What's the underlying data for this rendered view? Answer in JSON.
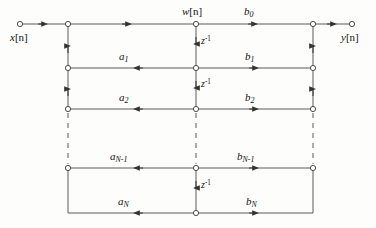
{
  "figure": {
    "kind": "signal-flow-graph",
    "background_color": "#fdfdfb",
    "line_color": "#555555",
    "text_color": "#111111"
  },
  "signals": {
    "input_label": "x[n]",
    "input_base": "x",
    "input_index": "[n]",
    "output_label": "y[n]",
    "output_base": "y",
    "output_index": "[n]",
    "state_label": "w[n]",
    "state_base": "w",
    "state_index": "[n]"
  },
  "delay": {
    "label": "z",
    "exponent": "-1",
    "full_label": "z^-1",
    "count": 4
  },
  "feedback_coefficients": [
    {
      "id": "a1",
      "base": "a",
      "subscript": "1",
      "label": "a1",
      "row": 1
    },
    {
      "id": "a2",
      "base": "a",
      "subscript": "2",
      "label": "a2",
      "row": 2
    },
    {
      "id": "aNm1",
      "base": "a",
      "subscript": "N-1",
      "label": "aN-1",
      "row": 3
    },
    {
      "id": "aN",
      "base": "a",
      "subscript": "N",
      "label": "aN",
      "row": 4
    }
  ],
  "feedforward_coefficients": [
    {
      "id": "b0",
      "base": "b",
      "subscript": "0",
      "label": "b0",
      "row": 0
    },
    {
      "id": "b1",
      "base": "b",
      "subscript": "1",
      "label": "b1",
      "row": 1
    },
    {
      "id": "b2",
      "base": "b",
      "subscript": "2",
      "label": "b2",
      "row": 2
    },
    {
      "id": "bNm1",
      "base": "b",
      "subscript": "N-1",
      "label": "bN-1",
      "row": 3
    },
    {
      "id": "bN",
      "base": "b",
      "subscript": "N",
      "label": "bN",
      "row": 4
    }
  ],
  "geometry": {
    "left_column_x": 68,
    "center_column_x": 196,
    "right_column_x": 313,
    "input_node_x": 20,
    "output_node_x": 352,
    "row_y": [
      24,
      68,
      109,
      168,
      213
    ],
    "dashed_top_y": 112,
    "dashed_bottom_y": 165
  }
}
